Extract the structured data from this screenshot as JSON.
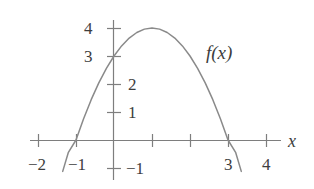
{
  "figure": {
    "background_color": "#ffffff",
    "width": 314,
    "height": 189
  },
  "chart_data": {
    "type": "line",
    "title": "",
    "subtitle": "",
    "xlabel": "x",
    "ylabel": "",
    "grid": false,
    "legend_position": "inline-annotation",
    "xlim": [
      -2.2,
      4.4
    ],
    "ylim": [
      -1.4,
      4.5
    ],
    "x_ticks": [
      -2,
      -1,
      0,
      1,
      2,
      3,
      4
    ],
    "x_tick_labels": [
      "−2",
      "−1",
      "",
      "",
      "",
      "3",
      "4"
    ],
    "y_ticks": [
      -1,
      1,
      2,
      3,
      4
    ],
    "y_tick_labels": [
      "−1",
      "1",
      "2",
      "3",
      "4"
    ],
    "series": [
      {
        "name": "f(x)",
        "equation": "f(x) = −x² + 2x + 3",
        "color": "#8a8a8a",
        "roots": [
          -1,
          3
        ],
        "vertex": [
          1,
          4
        ],
        "y_intercept": 3,
        "x": [
          -1.35,
          -1.2,
          -1.0,
          -0.8,
          -0.6,
          -0.4,
          -0.2,
          0.0,
          0.2,
          0.4,
          0.6,
          0.8,
          1.0,
          1.2,
          1.4,
          1.6,
          1.8,
          2.0,
          2.2,
          2.4,
          2.6,
          2.8,
          3.0,
          3.2,
          3.35
        ],
        "values": [
          -1.12,
          -0.44,
          0.0,
          0.76,
          1.44,
          2.04,
          2.56,
          3.0,
          3.36,
          3.64,
          3.84,
          3.96,
          4.0,
          3.96,
          3.84,
          3.64,
          3.36,
          3.0,
          2.56,
          2.04,
          1.44,
          0.76,
          0.0,
          -0.44,
          -1.12
        ]
      }
    ],
    "annotations": [
      {
        "text": "f(x)",
        "x": 2.55,
        "y": 3.15
      },
      {
        "text": "x",
        "x": 4.65,
        "y": 0.0
      }
    ]
  },
  "axes": {
    "color": "#7e7e7e",
    "origin_px": {
      "x": 114,
      "y": 140
    },
    "unit_px": {
      "x": 38,
      "y": 28
    },
    "x_axis_label": "x",
    "y_axis_label": ""
  },
  "labels": {
    "y_left": [
      {
        "text": "4",
        "left": 84,
        "top": 20
      },
      {
        "text": "3",
        "left": 84,
        "top": 48
      }
    ],
    "y_right": [
      {
        "text": "2",
        "left": 128,
        "top": 76
      },
      {
        "text": "1",
        "left": 128,
        "top": 104
      },
      {
        "text": "−1",
        "left": 126,
        "top": 160
      }
    ],
    "x_below": [
      {
        "text": "−2",
        "left": 28,
        "top": 156
      },
      {
        "text": "−1",
        "left": 68,
        "top": 156
      },
      {
        "text": "3",
        "left": 224,
        "top": 156
      },
      {
        "text": "4",
        "left": 262,
        "top": 156
      }
    ],
    "curve_label": {
      "text": "f(x)",
      "left": 206,
      "top": 43
    },
    "x_axis_name": {
      "text": "x",
      "left": 288,
      "top": 132
    }
  }
}
